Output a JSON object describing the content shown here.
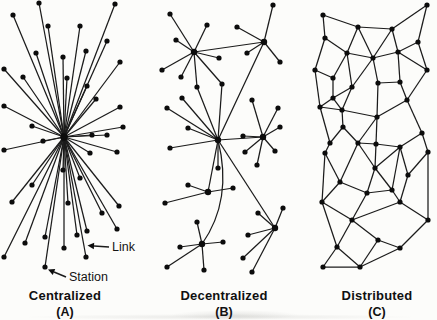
{
  "figure": {
    "bg": "#fcfcfa",
    "ink": "#1b1b1b",
    "dot": "#0c0c0c",
    "text": "#111111"
  },
  "annotations": [
    {
      "label": "Link",
      "arrow": [
        109,
        247,
        94,
        246
      ]
    },
    {
      "label": "Station",
      "arrow": [
        66,
        277,
        54,
        272
      ]
    }
  ],
  "networks": [
    {
      "key": "centralized",
      "caption": "Centralized",
      "sub": "(A)",
      "caption_x": 65,
      "star_from": 0,
      "hubs": [
        0
      ],
      "hub_radius": 3.8,
      "nodes": [
        [
          64,
          137
        ],
        [
          39,
          3
        ],
        [
          115,
          4
        ],
        [
          13,
          15
        ],
        [
          48,
          26
        ],
        [
          80,
          26
        ],
        [
          107,
          41
        ],
        [
          36,
          53
        ],
        [
          63,
          57
        ],
        [
          86,
          51
        ],
        [
          120,
          62
        ],
        [
          4,
          69
        ],
        [
          23,
          77
        ],
        [
          67,
          78
        ],
        [
          87,
          86
        ],
        [
          4,
          106
        ],
        [
          96,
          99
        ],
        [
          120,
          107
        ],
        [
          32,
          126
        ],
        [
          123,
          127
        ],
        [
          4,
          150
        ],
        [
          43,
          141
        ],
        [
          92,
          135
        ],
        [
          107,
          135
        ],
        [
          90,
          153
        ],
        [
          117,
          152
        ],
        [
          63,
          170
        ],
        [
          80,
          178
        ],
        [
          32,
          185
        ],
        [
          12,
          202
        ],
        [
          68,
          203
        ],
        [
          102,
          213
        ],
        [
          119,
          206
        ],
        [
          45,
          237
        ],
        [
          25,
          243
        ],
        [
          77,
          235
        ],
        [
          87,
          231
        ],
        [
          117,
          229
        ],
        [
          64,
          248
        ],
        [
          86,
          257
        ],
        [
          4,
          257
        ],
        [
          45,
          267
        ]
      ],
      "edges": [],
      "curves": []
    },
    {
      "key": "decentralized",
      "caption": "Decentralized",
      "sub": "(B)",
      "caption_x": 224,
      "star_from": null,
      "hubs": [
        0,
        1,
        2,
        3,
        4,
        5,
        6
      ],
      "hub_radius": 3.2,
      "nodes": [
        [
          194,
          52
        ],
        [
          264,
          42
        ],
        [
          218,
          140
        ],
        [
          263,
          137
        ],
        [
          208,
          192
        ],
        [
          202,
          244
        ],
        [
          275,
          228
        ],
        [
          197,
          87
        ],
        [
          222,
          84
        ],
        [
          170,
          14
        ],
        [
          207,
          25
        ],
        [
          176,
          40
        ],
        [
          162,
          70
        ],
        [
          181,
          77
        ],
        [
          219,
          58
        ],
        [
          273,
          5
        ],
        [
          237,
          27
        ],
        [
          247,
          53
        ],
        [
          280,
          62
        ],
        [
          182,
          98
        ],
        [
          167,
          108
        ],
        [
          188,
          128
        ],
        [
          170,
          148
        ],
        [
          218,
          168
        ],
        [
          252,
          100
        ],
        [
          278,
          108
        ],
        [
          280,
          127
        ],
        [
          243,
          136
        ],
        [
          245,
          152
        ],
        [
          275,
          151
        ],
        [
          257,
          165
        ],
        [
          188,
          185
        ],
        [
          165,
          203
        ],
        [
          233,
          188
        ],
        [
          197,
          222
        ],
        [
          180,
          247
        ],
        [
          223,
          242
        ],
        [
          167,
          267
        ],
        [
          204,
          270
        ],
        [
          283,
          208
        ],
        [
          258,
          213
        ],
        [
          248,
          235
        ],
        [
          243,
          258
        ],
        [
          252,
          272
        ]
      ],
      "edges": [
        [
          0,
          9
        ],
        [
          0,
          10
        ],
        [
          0,
          11
        ],
        [
          0,
          12
        ],
        [
          0,
          13
        ],
        [
          0,
          14
        ],
        [
          0,
          7
        ],
        [
          0,
          8
        ],
        [
          0,
          1
        ],
        [
          1,
          15
        ],
        [
          1,
          16
        ],
        [
          1,
          17
        ],
        [
          1,
          18
        ],
        [
          1,
          2
        ],
        [
          2,
          7
        ],
        [
          2,
          8
        ],
        [
          2,
          19
        ],
        [
          2,
          20
        ],
        [
          2,
          21
        ],
        [
          2,
          22
        ],
        [
          2,
          23
        ],
        [
          2,
          3
        ],
        [
          2,
          4
        ],
        [
          2,
          6
        ],
        [
          3,
          24
        ],
        [
          3,
          25
        ],
        [
          3,
          26
        ],
        [
          3,
          27
        ],
        [
          3,
          28
        ],
        [
          3,
          29
        ],
        [
          3,
          30
        ],
        [
          4,
          31
        ],
        [
          4,
          32
        ],
        [
          4,
          33
        ],
        [
          5,
          34
        ],
        [
          5,
          35
        ],
        [
          5,
          36
        ],
        [
          5,
          37
        ],
        [
          5,
          38
        ],
        [
          6,
          39
        ],
        [
          6,
          40
        ],
        [
          6,
          41
        ],
        [
          6,
          42
        ],
        [
          6,
          43
        ]
      ],
      "curves": [
        [
          2,
          5,
          233,
          200
        ]
      ]
    },
    {
      "key": "distributed",
      "caption": "Distributed",
      "sub": "(C)",
      "caption_x": 377,
      "star_from": null,
      "hubs": [],
      "hub_radius": 2.7,
      "nodes": [
        [
          323,
          15
        ],
        [
          427,
          5
        ],
        [
          358,
          27
        ],
        [
          392,
          29
        ],
        [
          325,
          38
        ],
        [
          418,
          42
        ],
        [
          347,
          53
        ],
        [
          373,
          58
        ],
        [
          398,
          52
        ],
        [
          315,
          70
        ],
        [
          427,
          70
        ],
        [
          333,
          78
        ],
        [
          352,
          87
        ],
        [
          378,
          83
        ],
        [
          400,
          82
        ],
        [
          320,
          107
        ],
        [
          342,
          110
        ],
        [
          377,
          117
        ],
        [
          407,
          100
        ],
        [
          343,
          127
        ],
        [
          330,
          143
        ],
        [
          358,
          143
        ],
        [
          376,
          144
        ],
        [
          400,
          147
        ],
        [
          422,
          133
        ],
        [
          325,
          153
        ],
        [
          428,
          152
        ],
        [
          340,
          182
        ],
        [
          375,
          168
        ],
        [
          408,
          175
        ],
        [
          367,
          193
        ],
        [
          392,
          190
        ],
        [
          322,
          202
        ],
        [
          400,
          202
        ],
        [
          352,
          220
        ],
        [
          428,
          220
        ],
        [
          337,
          247
        ],
        [
          378,
          240
        ],
        [
          400,
          248
        ],
        [
          323,
          267
        ],
        [
          360,
          267
        ],
        [
          333,
          98
        ]
      ],
      "edges": [
        [
          0,
          2
        ],
        [
          0,
          4
        ],
        [
          1,
          3
        ],
        [
          1,
          5
        ],
        [
          2,
          3
        ],
        [
          2,
          6
        ],
        [
          2,
          7
        ],
        [
          3,
          7
        ],
        [
          3,
          8
        ],
        [
          4,
          6
        ],
        [
          4,
          9
        ],
        [
          5,
          8
        ],
        [
          5,
          10
        ],
        [
          6,
          7
        ],
        [
          6,
          11
        ],
        [
          6,
          12
        ],
        [
          7,
          8
        ],
        [
          7,
          12
        ],
        [
          7,
          13
        ],
        [
          8,
          10
        ],
        [
          8,
          14
        ],
        [
          9,
          11
        ],
        [
          9,
          15
        ],
        [
          11,
          41
        ],
        [
          12,
          41
        ],
        [
          15,
          41
        ],
        [
          16,
          41
        ],
        [
          12,
          16
        ],
        [
          13,
          14
        ],
        [
          13,
          17
        ],
        [
          14,
          18
        ],
        [
          10,
          18
        ],
        [
          15,
          16
        ],
        [
          15,
          20
        ],
        [
          16,
          17
        ],
        [
          16,
          19
        ],
        [
          17,
          18
        ],
        [
          17,
          21
        ],
        [
          17,
          22
        ],
        [
          18,
          24
        ],
        [
          19,
          20
        ],
        [
          19,
          21
        ],
        [
          20,
          25
        ],
        [
          21,
          22
        ],
        [
          21,
          27
        ],
        [
          21,
          28
        ],
        [
          22,
          23
        ],
        [
          22,
          28
        ],
        [
          23,
          24
        ],
        [
          23,
          28
        ],
        [
          23,
          29
        ],
        [
          23,
          31
        ],
        [
          24,
          26
        ],
        [
          25,
          27
        ],
        [
          25,
          32
        ],
        [
          26,
          29
        ],
        [
          26,
          35
        ],
        [
          27,
          30
        ],
        [
          27,
          32
        ],
        [
          28,
          30
        ],
        [
          28,
          31
        ],
        [
          29,
          33
        ],
        [
          30,
          31
        ],
        [
          30,
          34
        ],
        [
          31,
          33
        ],
        [
          32,
          34
        ],
        [
          32,
          36
        ],
        [
          33,
          34
        ],
        [
          33,
          35
        ],
        [
          34,
          36
        ],
        [
          34,
          37
        ],
        [
          35,
          38
        ],
        [
          36,
          39
        ],
        [
          36,
          40
        ],
        [
          37,
          38
        ],
        [
          37,
          40
        ],
        [
          38,
          40
        ],
        [
          39,
          40
        ]
      ],
      "curves": []
    }
  ]
}
